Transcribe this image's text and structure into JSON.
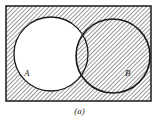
{
  "diagram": {
    "type": "venn",
    "sets": [
      {
        "label": "A",
        "cx": 51,
        "cy": 54,
        "r": 37
      },
      {
        "label": "B",
        "cx": 113,
        "cy": 56,
        "r": 37
      }
    ],
    "shaded_region": "complement of (A minus B)",
    "universe": {
      "x": 6,
      "y": 6,
      "width": 145,
      "height": 95
    },
    "colors": {
      "stroke": "#1a1a1a",
      "hatch": "#333333",
      "background": "#ffffff"
    }
  },
  "labels": {
    "set_a": "A",
    "set_b": "B",
    "caption": "(a)"
  }
}
